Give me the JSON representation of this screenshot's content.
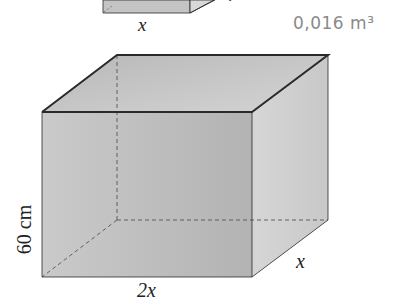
{
  "small_box": {
    "width_label": "x",
    "depth_label_partial": "40",
    "annotation": "0,016 m³"
  },
  "large_box": {
    "height_label": "60 cm",
    "width_label": "2x",
    "depth_label": "x"
  },
  "colors": {
    "face_front": "#bdbdbd",
    "face_side": "#cfcfcf",
    "face_top_inner": "#c6c6c6",
    "edge": "#2a2a2a",
    "dashed": "#555555",
    "annotation_ink": "#8a8a8a"
  }
}
